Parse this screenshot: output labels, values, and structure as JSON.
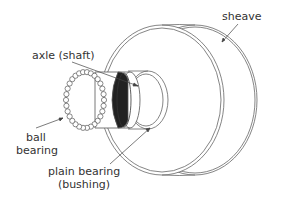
{
  "diagram": {
    "type": "mechanical-illustration",
    "labels": {
      "sheave": "sheave",
      "axle": "axle (shaft)",
      "ball_bearing_line1": "ball",
      "ball_bearing_line2": "bearing",
      "plain_bearing_line1": "plain bearing",
      "plain_bearing_line2": "(bushing)"
    },
    "colors": {
      "line": "#555555",
      "text": "#333333",
      "axle_shading": "#222222",
      "background": "#ffffff"
    }
  }
}
